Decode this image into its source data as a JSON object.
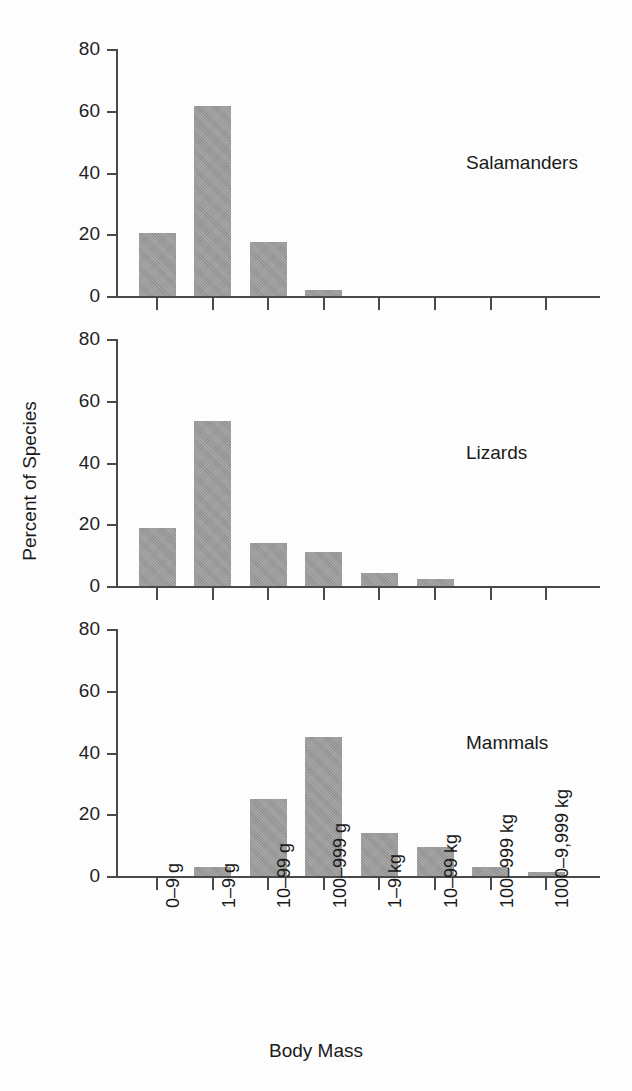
{
  "chart_data": {
    "type": "bar",
    "title": "",
    "xlabel": "Body Mass",
    "ylabel": "Percent of Species",
    "ylim": [
      0,
      80
    ],
    "yticks": [
      0,
      20,
      40,
      60,
      80
    ],
    "grid": false,
    "legend": "none",
    "layout": "3 stacked panels sharing one x axis",
    "categories": [
      "0–9 g",
      "1–9 g",
      "10–99 g",
      "100–999 g",
      "1–9 kg",
      "10–99 kg",
      "100–999 kg",
      "1000–9,999 kg"
    ],
    "series": [
      {
        "name": "Salamanders",
        "values": [
          20.5,
          61.5,
          17.5,
          2.0,
          0,
          0,
          0,
          0
        ]
      },
      {
        "name": "Lizards",
        "values": [
          18.7,
          53.5,
          13.8,
          11.0,
          4.2,
          2.4,
          0,
          0
        ]
      },
      {
        "name": "Mammals",
        "values": [
          0,
          3.0,
          25.0,
          45.0,
          14.0,
          9.3,
          3.0,
          1.3
        ]
      }
    ]
  },
  "axis": {
    "y_tick_labels": [
      "0",
      "20",
      "40",
      "60",
      "80"
    ],
    "y_title": "Percent of Species",
    "x_title": "Body Mass"
  },
  "panels": [
    {
      "label": "Salamanders"
    },
    {
      "label": "Lizards"
    },
    {
      "label": "Mammals"
    }
  ],
  "colors": {
    "bar_fill": "#989898",
    "axis": "#494949",
    "text": "#1a1a1a",
    "background": "#fdfdfd"
  }
}
